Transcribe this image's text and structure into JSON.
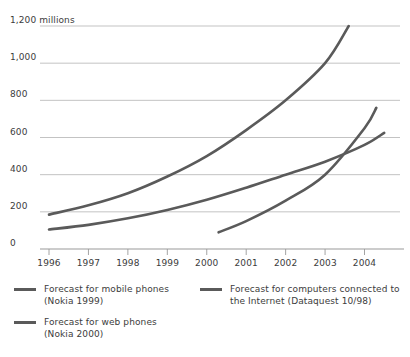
{
  "chart_data": {
    "type": "line",
    "title": "",
    "subtitle": "",
    "xlabel": "",
    "ylabel": "millions",
    "y_axis_top_label": "1,200 millions",
    "xlim": [
      1996,
      2004.9
    ],
    "ylim": [
      0,
      1200
    ],
    "grid": true,
    "grid_axis": "y",
    "legend_position": "bottom",
    "yticks": [
      0,
      200,
      400,
      600,
      800,
      1000,
      1200
    ],
    "ytick_labels": [
      "0",
      "200",
      "400",
      "600",
      "800",
      "1,000",
      "1,200 millions"
    ],
    "xticks": [
      1996,
      1997,
      1998,
      1999,
      2000,
      2001,
      2002,
      2003,
      2004
    ],
    "xtick_labels": [
      "1996",
      "1997",
      "1998",
      "1999",
      "2000",
      "2001",
      "2002",
      "2003",
      "2004"
    ],
    "line_color": "#5a5a5a",
    "grid_color": "#b4b4b4",
    "axis_color": "#9a9a9a",
    "series": [
      {
        "name": "Forecast for mobile phones (Nokia 1999)",
        "legend_label": "Forecast for mobile phones\n(Nokia 1999)",
        "color": "#5a5a5a",
        "x": [
          1996,
          1997,
          1998,
          1999,
          2000,
          2001,
          2002,
          2003,
          2003.6
        ],
        "values": [
          185,
          235,
          300,
          390,
          500,
          640,
          800,
          1000,
          1200
        ]
      },
      {
        "name": "Forecast for computers connected to the Internet (Dataquest 10/98)",
        "legend_label": "Forecast for computers connected to\nthe Internet (Dataquest 10/98)",
        "color": "#5a5a5a",
        "x": [
          1996,
          1997,
          1998,
          1999,
          2000,
          2001,
          2002,
          2003,
          2004,
          2004.5
        ],
        "values": [
          105,
          130,
          165,
          210,
          265,
          330,
          400,
          470,
          560,
          625
        ]
      },
      {
        "name": "Forecast for web phones (Nokia 2000)",
        "legend_label": "Forecast for web phones\n(Nokia 2000)",
        "color": "#5a5a5a",
        "x": [
          2000.3,
          2001,
          2002,
          2003,
          2004,
          2004.3
        ],
        "values": [
          90,
          150,
          260,
          400,
          650,
          760
        ]
      }
    ]
  },
  "legend": {
    "entries": [
      {
        "label": "Forecast for mobile phones\n(Nokia 1999)"
      },
      {
        "label": "Forecast for web phones\n(Nokia 2000)"
      },
      {
        "label": "Forecast for computers connected to\nthe Internet (Dataquest 10/98)"
      }
    ]
  }
}
